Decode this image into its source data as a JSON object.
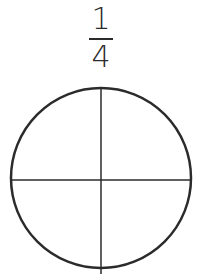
{
  "fraction": {
    "numerator": "1",
    "denominator": "4"
  },
  "diagram": {
    "shape": "circle",
    "divisions": 4,
    "stroke_color": "#2b2b2b"
  }
}
